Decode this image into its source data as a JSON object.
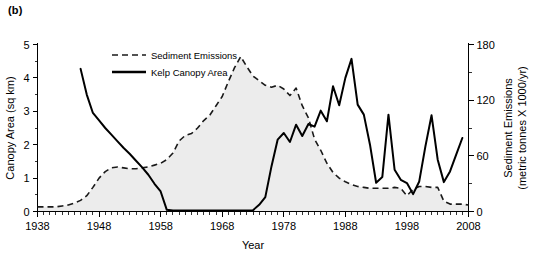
{
  "figure": {
    "panel_label": "(b)"
  },
  "chart_data": {
    "type": "line",
    "title": "",
    "xlabel": "Year",
    "ylabel": "Canopy Area (sq km)",
    "y2label_line1": "Sediment Emissions",
    "y2label_line2": "(metric tonnes X 1000/yr)",
    "xlim": [
      1938,
      2008
    ],
    "ylim": [
      0,
      5
    ],
    "y2lim": [
      0,
      180
    ],
    "xticks": [
      1938,
      1948,
      1958,
      1968,
      1978,
      1988,
      1998,
      2008
    ],
    "xtick_labels": [
      "1938",
      "1948",
      "1958",
      "1968",
      "1978",
      "1988",
      "1998",
      "2008"
    ],
    "xminor_step": 1,
    "yticks": [
      0,
      1,
      2,
      3,
      4,
      5
    ],
    "ytick_labels": [
      "0",
      "1",
      "2",
      "3",
      "4",
      "5"
    ],
    "y2ticks": [
      0,
      60,
      120,
      180
    ],
    "y2tick_labels": [
      "0",
      "60",
      "120",
      "180"
    ],
    "y2minor_ticks": [
      30,
      90,
      150
    ],
    "grid": false,
    "legend_position": "top-left-inside",
    "series": [
      {
        "name": "Sediment Emissions",
        "axis": "right",
        "style": "dashed",
        "shaded": true,
        "units": "metric tonnes X 1000/yr",
        "x": [
          1938,
          1939,
          1940,
          1941,
          1942,
          1943,
          1944,
          1945,
          1946,
          1947,
          1948,
          1949,
          1950,
          1951,
          1952,
          1953,
          1954,
          1955,
          1956,
          1957,
          1958,
          1959,
          1960,
          1961,
          1962,
          1963,
          1964,
          1965,
          1966,
          1967,
          1968,
          1969,
          1970,
          1971,
          1972,
          1973,
          1974,
          1975,
          1976,
          1977,
          1978,
          1979,
          1980,
          1981,
          1982,
          1983,
          1984,
          1985,
          1986,
          1987,
          1988,
          1989,
          1990,
          1991,
          1992,
          1993,
          1994,
          1995,
          1996,
          1997,
          1998,
          1999,
          2000,
          2001,
          2002,
          2003,
          2004,
          2005,
          2006,
          2007,
          2008
        ],
        "values": [
          5,
          5,
          5,
          5,
          6,
          7,
          9,
          12,
          17,
          26,
          36,
          43,
          47,
          48,
          47,
          46,
          46,
          47,
          48,
          50,
          52,
          56,
          63,
          76,
          82,
          84,
          90,
          98,
          104,
          114,
          124,
          140,
          155,
          167,
          156,
          146,
          141,
          136,
          134,
          136,
          132,
          125,
          133,
          114,
          101,
          78,
          66,
          52,
          42,
          36,
          32,
          29,
          27,
          26,
          25,
          25,
          25,
          25,
          26,
          25,
          17,
          24,
          27,
          27,
          26,
          26,
          11,
          8,
          8,
          8,
          7
        ]
      },
      {
        "name": "Kelp Canopy Area",
        "axis": "left",
        "style": "solid",
        "units": "sq km",
        "x": [
          1945,
          1946,
          1947,
          1948,
          1949,
          1950,
          1951,
          1952,
          1953,
          1954,
          1955,
          1956,
          1957,
          1958,
          1959,
          1960,
          1961,
          1962,
          1963,
          1964,
          1965,
          1966,
          1967,
          1968,
          1969,
          1970,
          1971,
          1972,
          1973,
          1974,
          1975,
          1976,
          1977,
          1978,
          1979,
          1980,
          1981,
          1982,
          1983,
          1984,
          1985,
          1986,
          1987,
          1988,
          1989,
          1990,
          1991,
          1992,
          1993,
          1994,
          1995,
          1996,
          1997,
          1998,
          1999,
          2000,
          2001,
          2002,
          2003,
          2004,
          2005,
          2006,
          2007
        ],
        "values": [
          4.27,
          3.5,
          2.95,
          2.73,
          2.5,
          2.3,
          2.1,
          1.9,
          1.72,
          1.52,
          1.32,
          1.1,
          0.83,
          0.6,
          0.05,
          0.03,
          0.03,
          0.03,
          0.03,
          0.03,
          0.03,
          0.03,
          0.03,
          0.03,
          0.03,
          0.03,
          0.03,
          0.03,
          0.04,
          0.2,
          0.43,
          1.35,
          2.15,
          2.35,
          2.08,
          2.6,
          2.26,
          2.62,
          2.54,
          3.02,
          2.7,
          3.75,
          3.18,
          4.0,
          4.57,
          3.2,
          2.9,
          2.0,
          0.86,
          1.03,
          2.9,
          1.25,
          0.95,
          0.85,
          0.52,
          0.9,
          1.95,
          2.88,
          1.55,
          0.88,
          1.2,
          1.7,
          2.2
        ]
      }
    ],
    "legend": [
      {
        "label": "Sediment Emissions",
        "style": "dashed"
      },
      {
        "label": "Kelp Canopy Area",
        "style": "solid"
      }
    ]
  }
}
